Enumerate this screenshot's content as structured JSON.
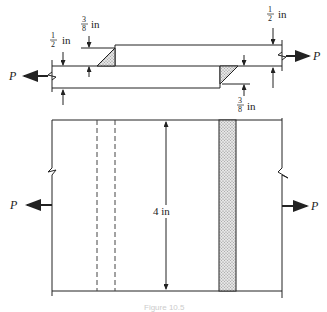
{
  "diagram": {
    "top_view": {
      "labels": {
        "plate_thickness_left": {
          "num": "1",
          "den": "2",
          "unit": "in"
        },
        "weld_size_left": {
          "num": "3",
          "den": "8",
          "unit": "in"
        },
        "plate_thickness_right": {
          "num": "1",
          "den": "2",
          "unit": "in"
        },
        "weld_size_right": {
          "num": "3",
          "den": "8",
          "unit": "in"
        }
      },
      "load_left": "P",
      "load_right": "P"
    },
    "plan_view": {
      "width_label": "4 in",
      "load_left": "P",
      "load_right": "P"
    },
    "caption": "Figure 10.5"
  },
  "colors": {
    "line": "#222222",
    "weld_fill": "#bdbdbd"
  }
}
